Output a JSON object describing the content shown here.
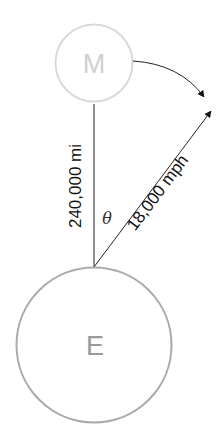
{
  "diagram": {
    "moon": {
      "label": "M",
      "stroke_color": "#d9d9d9",
      "text_color": "#cfcfcf"
    },
    "earth": {
      "label": "E",
      "stroke_color": "#a9a9a9",
      "text_color": "#9a9a9a"
    },
    "distance_label": "240,000 mi",
    "speed_label": "18,000 mph",
    "angle_label": "θ",
    "line_color": "#222222"
  }
}
